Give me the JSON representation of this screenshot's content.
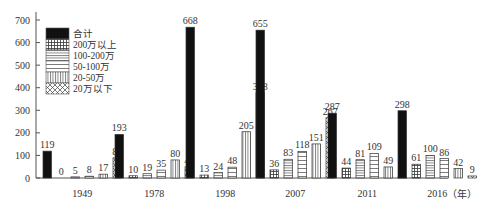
{
  "chart_data": {
    "type": "bar",
    "title": "",
    "xlabel": "（年）",
    "ylabel": "",
    "ylim": [
      0,
      700
    ],
    "yticks": [
      0,
      100,
      200,
      300,
      400,
      500,
      600,
      700
    ],
    "grid": false,
    "legend_position": "top-left inside",
    "categories": [
      "1949",
      "1978",
      "1998",
      "2007",
      "2011",
      "2016"
    ],
    "series": [
      {
        "name": "合计",
        "pattern": "solid-black",
        "values": [
          119,
          193,
          668,
          655,
          287,
          298
        ]
      },
      {
        "name": "200万以上",
        "pattern": "grid",
        "values": [
          0,
          10,
          13,
          36,
          44,
          61
        ]
      },
      {
        "name": "100-200万",
        "pattern": "horizontal-lines-dense",
        "values": [
          5,
          19,
          24,
          83,
          81,
          100
        ]
      },
      {
        "name": "50-100万",
        "pattern": "horizontal-lines",
        "values": [
          8,
          35,
          48,
          118,
          109,
          86
        ]
      },
      {
        "name": "20-50万",
        "pattern": "vertical-lines",
        "values": [
          17,
          80,
          205,
          151,
          49,
          42
        ]
      },
      {
        "name": "20万以下",
        "pattern": "crosshatch",
        "values": [
          89,
          49,
          378,
          267,
          4,
          9
        ]
      }
    ]
  }
}
